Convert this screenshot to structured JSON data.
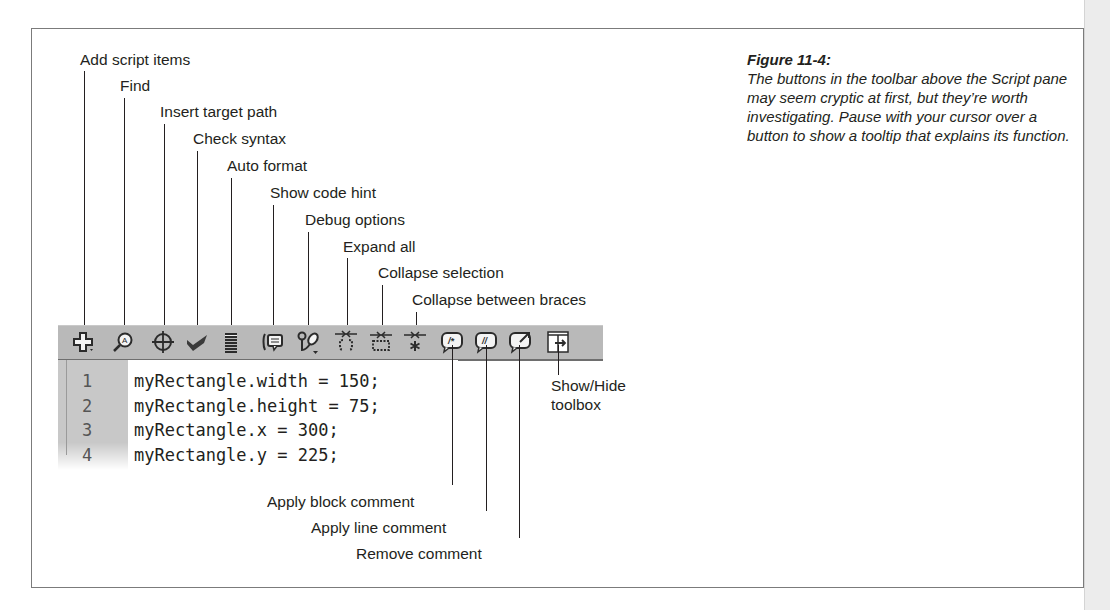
{
  "figure": {
    "title": "Figure 11-4:",
    "caption": "The buttons in the toolbar above the Script pane may seem cryptic at first, but they’re worth investigating. Pause with your cursor over a button to show a tooltip that explains its function."
  },
  "callouts_top": [
    {
      "label": "Add script items"
    },
    {
      "label": "Find"
    },
    {
      "label": "Insert target path"
    },
    {
      "label": "Check syntax"
    },
    {
      "label": "Auto format"
    },
    {
      "label": "Show code hint"
    },
    {
      "label": "Debug options"
    },
    {
      "label": "Expand all"
    },
    {
      "label": "Collapse selection"
    },
    {
      "label": "Collapse between braces"
    }
  ],
  "callouts_bottom": [
    {
      "label": "Apply block comment"
    },
    {
      "label": "Apply line comment"
    },
    {
      "label": "Remove comment"
    }
  ],
  "callout_side": {
    "line1": "Show/Hide",
    "line2": "toolbox"
  },
  "toolbar": {
    "icons": [
      "add-script-items-icon",
      "find-icon",
      "insert-target-path-icon",
      "check-syntax-icon",
      "auto-format-icon",
      "show-code-hint-icon",
      "debug-options-icon",
      "expand-all-icon",
      "collapse-selection-icon",
      "collapse-between-braces-icon",
      "apply-block-comment-icon",
      "apply-line-comment-icon",
      "remove-comment-icon",
      "show-hide-toolbox-icon"
    ],
    "colors": {
      "background": "#b9b9b9",
      "icon": "#2b2b2b",
      "accent_red": "#c0392b"
    }
  },
  "script": {
    "lines": [
      {
        "num": "1",
        "code": "myRectangle.width = 150;"
      },
      {
        "num": "2",
        "code": "myRectangle.height = 75;"
      },
      {
        "num": "3",
        "code": "myRectangle.x = 300;"
      },
      {
        "num": "4",
        "code": "myRectangle.y = 225;"
      }
    ]
  }
}
